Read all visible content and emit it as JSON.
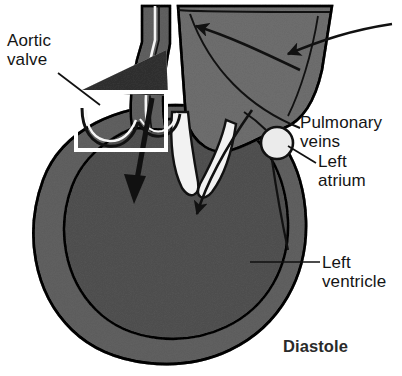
{
  "figure": {
    "background_color": "#ffffff",
    "ink_color": "#111111",
    "muscle_fill": "#9b9b9b",
    "cavity_fill": "#8e8e8e",
    "atrium_fill": "#a6a6a6",
    "wedge_fill": "#6f6f6f",
    "valve_leaflet_fill": "#f2f2f2",
    "highlight_border": "#ffffff"
  },
  "labels": {
    "aortic_valve": "Aortic\nvalve",
    "pulmonary_veins": "Pulmonary\nveins",
    "left_atrium": "Left\natrium",
    "left_ventricle": "Left\nventricle",
    "phase": "Diastole"
  },
  "structures": {
    "aorta": "aorta",
    "aortic_valve": "aortic-valve-cusps",
    "left_atrium": "left-atrium-chamber",
    "pulmonary_vein_opening": "pulmonary-vein-opening",
    "mitral_valve": "mitral-valve-leaflets",
    "left_ventricle_wall": "left-ventricle-myocardium",
    "left_ventricle_cavity": "left-ventricle-cavity"
  },
  "flow_arrows": [
    {
      "name": "inflow-from-right",
      "meaning": "blood entering left atrium from right"
    },
    {
      "name": "inflow-from-top",
      "meaning": "blood entering left atrium from above"
    },
    {
      "name": "mitral-inflow",
      "meaning": "blood flowing through mitral valve into left ventricle"
    },
    {
      "name": "aortic-root-arrow",
      "meaning": "thick arrow at aortic valve region"
    }
  ]
}
